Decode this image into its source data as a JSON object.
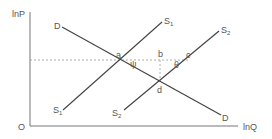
{
  "diagram": {
    "axes": {
      "y_label": "lnP",
      "x_label": "lnQ",
      "origin_label": "O"
    },
    "curves": {
      "demand": {
        "label_top": "D",
        "label_bottom": "D"
      },
      "supply1": {
        "label_top": "S",
        "label_top_sub": "1",
        "label_bottom": "S",
        "label_bottom_sub": "1"
      },
      "supply2": {
        "label_top": "S",
        "label_top_sub": "2",
        "label_bottom": "S",
        "label_bottom_sub": "2"
      }
    },
    "points": {
      "a": "a",
      "b": "b",
      "c": "c",
      "d": "d"
    },
    "angles": {
      "psi": "ψ",
      "theta": "θ"
    },
    "colors": {
      "line": "#444444",
      "axis": "#777777",
      "dashed": "#999999",
      "text": "#555555"
    }
  }
}
